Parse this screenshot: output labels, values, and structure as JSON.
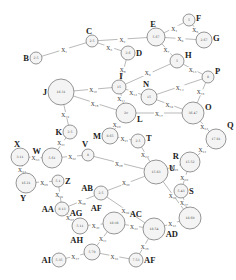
{
  "diagram": {
    "type": "weighted-graph",
    "nodes": [
      {
        "id": "B",
        "label": "B",
        "value": "2.5",
        "x": 36,
        "y": 58,
        "r": 6,
        "lx": -9,
        "ly": 0
      },
      {
        "id": "C",
        "label": "C",
        "value": "2.5",
        "x": 92,
        "y": 41,
        "r": 6,
        "lx": -3,
        "ly": -10
      },
      {
        "id": "D",
        "label": "D",
        "value": "2.6",
        "x": 128,
        "y": 53,
        "r": 7,
        "lx": 9,
        "ly": 0
      },
      {
        "id": "E",
        "label": "E",
        "value": "5.67",
        "x": 156,
        "y": 37,
        "r": 9,
        "lx": -3,
        "ly": -13
      },
      {
        "id": "F",
        "label": "F",
        "value": "5",
        "x": 189,
        "y": 20,
        "r": 6,
        "lx": 8,
        "ly": -2
      },
      {
        "id": "G",
        "label": "G",
        "value": "2.67",
        "x": 204,
        "y": 40,
        "r": 8,
        "lx": 10,
        "ly": -2
      },
      {
        "id": "H",
        "label": "H",
        "value": "5",
        "x": 177,
        "y": 61,
        "r": 7,
        "lx": 8,
        "ly": -6
      },
      {
        "id": "I",
        "label": "I",
        "value": "15",
        "x": 119,
        "y": 87,
        "r": 7,
        "lx": 2,
        "ly": -11
      },
      {
        "id": "J",
        "label": "J",
        "value": "18.31",
        "x": 61,
        "y": 92,
        "r": 13,
        "lx": -23,
        "ly": 0
      },
      {
        "id": "K",
        "label": "K",
        "value": "2.5",
        "x": 70,
        "y": 132,
        "r": 7,
        "lx": -12,
        "ly": 0
      },
      {
        "id": "L",
        "label": "L",
        "value": "20",
        "x": 126,
        "y": 113,
        "r": 10,
        "lx": 12,
        "ly": 6
      },
      {
        "id": "M",
        "label": "M",
        "value": "8.65",
        "x": 110,
        "y": 136,
        "r": 8,
        "lx": -15,
        "ly": 0
      },
      {
        "id": "N",
        "label": "N",
        "value": "15",
        "x": 149,
        "y": 97,
        "r": 8,
        "lx": -3,
        "ly": -13
      },
      {
        "id": "O",
        "label": "O",
        "value": "36.47",
        "x": 193,
        "y": 113,
        "r": 11,
        "lx": 13,
        "ly": -6
      },
      {
        "id": "P",
        "label": "P",
        "value": "8",
        "x": 208,
        "y": 77,
        "r": 6,
        "lx": 8,
        "ly": -6
      },
      {
        "id": "Q",
        "label": "Q",
        "value": "17.81",
        "x": 216,
        "y": 139,
        "r": 10,
        "lx": 6,
        "ly": -14
      },
      {
        "id": "R",
        "label": "R",
        "value": "15.52",
        "x": 190,
        "y": 162,
        "r": 10,
        "lx": -13,
        "ly": -6
      },
      {
        "id": "S",
        "label": "S",
        "value": "5.43",
        "x": 181,
        "y": 191,
        "r": 7,
        "lx": 10,
        "ly": 0
      },
      {
        "id": "T",
        "label": "T",
        "value": "2.5",
        "x": 138,
        "y": 141,
        "r": 7,
        "lx": 9,
        "ly": -3
      },
      {
        "id": "U",
        "label": "U",
        "value": "15.83",
        "x": 156,
        "y": 172,
        "r": 12,
        "lx": 14,
        "ly": -4
      },
      {
        "id": "V",
        "label": "V",
        "value": "8",
        "x": 88,
        "y": 155,
        "r": 6,
        "lx": -3,
        "ly": -11
      },
      {
        "id": "W",
        "label": "W",
        "value": "5.61",
        "x": 52,
        "y": 158,
        "r": 10,
        "lx": -14,
        "ly": -7
      },
      {
        "id": "X",
        "label": "X",
        "value": "3.11",
        "x": 20,
        "y": 157,
        "r": 9,
        "lx": -3,
        "ly": -13
      },
      {
        "id": "Y",
        "label": "Y",
        "value": "16.21",
        "x": 26,
        "y": 183,
        "r": 10,
        "lx": -3,
        "ly": 15
      },
      {
        "id": "Z",
        "label": "Z",
        "value": "5.1",
        "x": 58,
        "y": 181,
        "r": 6,
        "lx": 10,
        "ly": 0
      },
      {
        "id": "AA",
        "label": "AA",
        "value": "8.13",
        "x": 62,
        "y": 209,
        "r": 7,
        "lx": -20,
        "ly": 0
      },
      {
        "id": "AB",
        "label": "AB",
        "value": "2.5",
        "x": 101,
        "y": 193,
        "r": 7,
        "lx": -16,
        "ly": -5
      },
      {
        "id": "AC",
        "label": "AC",
        "value": "18.54",
        "x": 154,
        "y": 229,
        "r": 11,
        "lx": -8,
        "ly": -15
      },
      {
        "id": "AD",
        "label": "AD",
        "value": "18.69",
        "x": 190,
        "y": 218,
        "r": 11,
        "lx": -6,
        "ly": 16
      },
      {
        "id": "AE",
        "label": "AF",
        "value": "18.08",
        "x": 114,
        "y": 223,
        "r": 11,
        "lx": -6,
        "ly": -15
      },
      {
        "id": "AF",
        "label": "AF",
        "value": "7.53",
        "x": 136,
        "y": 260,
        "r": 7,
        "lx": 8,
        "ly": 0
      },
      {
        "id": "AG",
        "label": "AG",
        "value": "5.11",
        "x": 80,
        "y": 226,
        "r": 8,
        "lx": -4,
        "ly": -13
      },
      {
        "id": "AH",
        "label": "AH",
        "value": "5.79",
        "x": 92,
        "y": 252,
        "r": 8,
        "lx": -12,
        "ly": -12
      },
      {
        "id": "AI",
        "label": "AI",
        "value": "5.35",
        "x": 59,
        "y": 260,
        "r": 7,
        "lx": -20,
        "ly": 0
      }
    ],
    "edges": [
      {
        "from": "B",
        "to": "C",
        "label": "X₁"
      },
      {
        "from": "C",
        "to": "E",
        "label": "X₂"
      },
      {
        "from": "C",
        "to": "D",
        "label": "X₃"
      },
      {
        "from": "E",
        "to": "F",
        "label": "X₄"
      },
      {
        "from": "F",
        "to": "G",
        "label": "X₅"
      },
      {
        "from": "E",
        "to": "G",
        "label": "X₆"
      },
      {
        "from": "E",
        "to": "H",
        "label": "X₇"
      },
      {
        "from": "D",
        "to": "I",
        "label": "X₈"
      },
      {
        "from": "H",
        "to": "I",
        "label": "X₉"
      },
      {
        "from": "J",
        "to": "I",
        "label": "X₁₀"
      },
      {
        "from": "I",
        "to": "L",
        "label": "X₁₁"
      },
      {
        "from": "I",
        "to": "N",
        "label": "X₁₂"
      },
      {
        "from": "H",
        "to": "P",
        "label": "X₁₃"
      },
      {
        "from": "N",
        "to": "P",
        "label": "X₁₄"
      },
      {
        "from": "P",
        "to": "O",
        "label": "X₁₅"
      },
      {
        "from": "N",
        "to": "O",
        "label": "X₁₆"
      },
      {
        "from": "L",
        "to": "O",
        "label": "X₁₇"
      },
      {
        "from": "J",
        "to": "L",
        "label": "X₁₈"
      },
      {
        "from": "J",
        "to": "K",
        "label": "X₁₉"
      },
      {
        "from": "L",
        "to": "M",
        "label": "X₂₀"
      },
      {
        "from": "M",
        "to": "T",
        "label": "X₂₁"
      },
      {
        "from": "T",
        "to": "U",
        "label": "X₂₂"
      },
      {
        "from": "O",
        "to": "Q",
        "label": "X₂₃"
      },
      {
        "from": "Q",
        "to": "R",
        "label": "X₂₄"
      },
      {
        "from": "U",
        "to": "R",
        "label": "X₂₅"
      },
      {
        "from": "U",
        "to": "AD",
        "label": "X₂₆"
      },
      {
        "from": "S",
        "to": "AD",
        "label": "X₂₇"
      },
      {
        "from": "V",
        "to": "U",
        "label": "X₂₈"
      },
      {
        "from": "R",
        "to": "S",
        "label": "X₂₉"
      },
      {
        "from": "U",
        "to": "AB",
        "label": "X₃₀"
      },
      {
        "from": "K",
        "to": "W",
        "label": "X₃₁"
      },
      {
        "from": "W",
        "to": "V",
        "label": "X₃₂"
      },
      {
        "from": "X",
        "to": "W",
        "label": "X₃₃"
      },
      {
        "from": "X",
        "to": "Y",
        "label": "X₃₄"
      },
      {
        "from": "Y",
        "to": "Z",
        "label": "X₃₅"
      },
      {
        "from": "Z",
        "to": "AA",
        "label": "X₃₆"
      },
      {
        "from": "AA",
        "to": "AG",
        "label": "X₃₇"
      },
      {
        "from": "AA",
        "to": "AB",
        "label": "X₃₈"
      },
      {
        "from": "AB",
        "to": "AC",
        "label": "X₃₉"
      },
      {
        "from": "AG",
        "to": "AE",
        "label": "X₄₀"
      },
      {
        "from": "AH",
        "to": "AE",
        "label": "X₄₁"
      },
      {
        "from": "AC",
        "to": "AD",
        "label": "X₄₂"
      },
      {
        "from": "AH",
        "to": "AF",
        "label": "X₄₃"
      },
      {
        "from": "AE",
        "to": "AC",
        "label": "X₄₄"
      },
      {
        "from": "AF",
        "to": "AC",
        "label": "X₄₅"
      },
      {
        "from": "AI",
        "to": "AH",
        "label": "X₄₇"
      }
    ]
  },
  "colors": {
    "background": "#ffffff",
    "node_fill": "#f4f4f4",
    "node_stroke": "#6a6a6a",
    "edge": "#8a8a8a",
    "text": "#222222"
  }
}
